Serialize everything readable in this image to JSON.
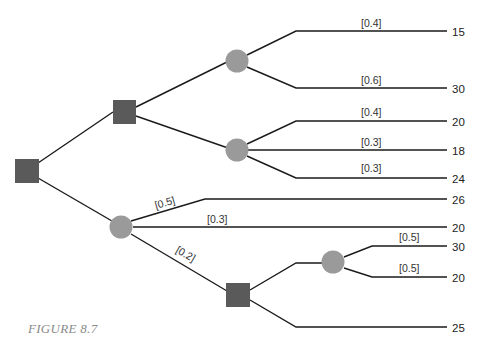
{
  "figure": {
    "caption": "FIGURE 8.7",
    "type": "decision-tree"
  },
  "colors": {
    "decision_node": "#5a5a5a",
    "chance_node": "#9a9a9a",
    "edge": "#1a1a1a",
    "caption": "#8a8a8a"
  },
  "nodes": {
    "root": {
      "kind": "decision"
    },
    "d1": {
      "kind": "decision"
    },
    "cA": {
      "kind": "chance"
    },
    "cB": {
      "kind": "chance"
    },
    "cC": {
      "kind": "chance"
    },
    "d2": {
      "kind": "decision"
    },
    "cD": {
      "kind": "chance"
    }
  },
  "branches": {
    "cA": [
      {
        "prob": "[0.4]",
        "payoff": "15"
      },
      {
        "prob": "[0.6]",
        "payoff": "30"
      }
    ],
    "cB": [
      {
        "prob": "[0.4]",
        "payoff": "20"
      },
      {
        "prob": "[0.3]",
        "payoff": "18"
      },
      {
        "prob": "[0.3]",
        "payoff": "24"
      }
    ],
    "cC": [
      {
        "prob": "[0.5]",
        "payoff": "26"
      },
      {
        "prob": "[0.3]",
        "payoff": "20"
      },
      {
        "prob": "[0.2]",
        "payoff": ""
      }
    ],
    "cD": [
      {
        "prob": "[0.5]",
        "payoff": "30"
      },
      {
        "prob": "[0.5]",
        "payoff": "20"
      }
    ],
    "d2": [
      {
        "payoff": "25"
      }
    ]
  }
}
